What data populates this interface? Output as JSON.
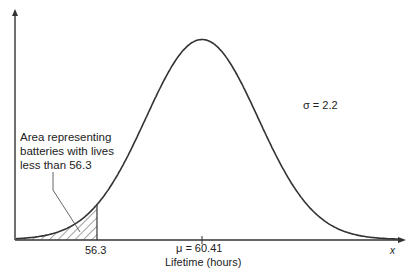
{
  "diagram": {
    "type": "normal-distribution-curve",
    "distribution": {
      "mean": 60.41,
      "std_dev": 2.2,
      "shaded_upper_bound": 56.3
    },
    "labels": {
      "area_line1": "Area representing",
      "area_line2": "batteries with lives",
      "area_line3": "less than 56.3",
      "sigma": "σ = 2.2",
      "cutoff_tick": "56.3",
      "mean": "μ = 60.41",
      "x_axis_title": "Lifetime (hours)",
      "x_variable": "x"
    },
    "colors": {
      "curve": "#333333",
      "axis": "#333333",
      "hatch": "#444444",
      "background": "#ffffff"
    }
  }
}
